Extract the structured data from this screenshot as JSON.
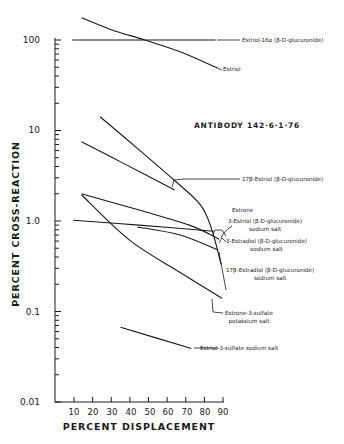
{
  "chart_data": {
    "type": "line",
    "xlabel": "PERCENT DISPLACEMENT",
    "ylabel": "PERCENT CROSS-REACTION",
    "xlim": [
      0,
      90
    ],
    "ylim": [
      0.01,
      200
    ],
    "yscale": "log",
    "xticks": [
      "10",
      "20",
      "30",
      "40",
      "50",
      "60",
      "70",
      "80",
      "90"
    ],
    "yticks": [
      "0.01",
      "0.1",
      "1.0",
      "10",
      "100"
    ],
    "grid": false,
    "legend_position": "inline labels right of curves",
    "series": [
      {
        "name": "Estriol-16α (β-D-glucuronide)",
        "x": [
          9,
          86
        ],
        "y": [
          100,
          100
        ]
      },
      {
        "name": "Estriol",
        "x": [
          14,
          30,
          48,
          67,
          87
        ],
        "y": [
          176,
          130,
          100,
          74,
          49
        ]
      },
      {
        "name": "17β-Estriol (β-D-glucuronide)",
        "x": [
          14,
          35,
          64
        ],
        "y": [
          7.5,
          4.5,
          2.2
        ]
      },
      {
        "name": "Estrone",
        "x": [
          24,
          45,
          64,
          78,
          84,
          89
        ],
        "y": [
          14.2,
          6.1,
          2.8,
          1.5,
          0.8,
          0.33
        ]
      },
      {
        "name": "3-Estriol (β-D-glucuronide) sodium salt",
        "x": [
          9.5,
          45,
          85
        ],
        "y": [
          1.02,
          0.9,
          0.77
        ]
      },
      {
        "name": "3-Estradiol (β-D-glucuronide) sodium salt",
        "x": [
          14,
          45,
          72,
          88
        ],
        "y": [
          2.0,
          1.32,
          0.9,
          0.63
        ]
      },
      {
        "name": "17β-Estradiol (β-D-glucuronide) sodium salt",
        "x": [
          44,
          67,
          87
        ],
        "y": [
          0.86,
          0.7,
          0.48
        ]
      },
      {
        "name": "Estrone-3-sulfate potassium salt",
        "x": [
          14,
          40,
          67,
          89.5
        ],
        "y": [
          1.95,
          0.61,
          0.27,
          0.14
        ]
      },
      {
        "name": "Estriol-3-sulfate sodium salt",
        "x": [
          35,
          73
        ],
        "y": [
          0.067,
          0.039
        ]
      }
    ]
  },
  "labels": {
    "antibody": "ANTIBODY 142·6·1·76",
    "ylabel": "PERCENT CROSS-REACTION",
    "xlabel": "PERCENT DISPLACEMENT",
    "estriol16a": "Estriol-16α (β-D-glucuronide)",
    "estriol": "Estriol",
    "estriol17b": "17β-Estriol (β-D-glucuronide)",
    "estrone": "Estrone",
    "estriol3_a": "3-Estriol (β-D-glucuronide)",
    "estriol3_b": "sodium salt",
    "estradiol3_a": "3-Estradiol (β-D-glucuronide)",
    "estradiol3_b": "sodium salt",
    "estradiol17b_a": "17β-Estradiol (β-D-glucuronide)",
    "estradiol17b_b": "sodium salt",
    "estrone3s_a": "Estrone-3-sulfate",
    "estrone3s_b": "potassium salt",
    "estriol3s": "Estriol-3-sulfate sodium salt"
  },
  "ticks": {
    "y": [
      "100",
      "10",
      "1.0",
      "0.1",
      "0.01"
    ],
    "x": [
      "10",
      "20",
      "30",
      "40",
      "50",
      "60",
      "70",
      "80",
      "90"
    ]
  }
}
